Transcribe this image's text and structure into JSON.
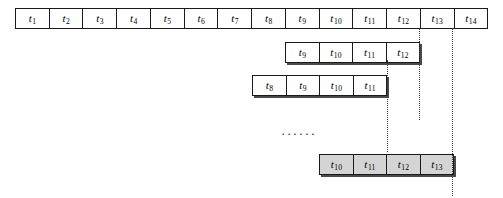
{
  "figure": {
    "ellipsis": "······",
    "colors": {
      "cell_border": "#1a1a1a",
      "shaded_fill": "#d4d4d4",
      "plain_fill": "#ffffff",
      "dotted_line": "#3a3a3a",
      "shadow": "#4a4a4a"
    },
    "rows": [
      {
        "name": "full-timeline",
        "shaded": false,
        "shadow": false,
        "left": 15,
        "top": 8,
        "height": 21,
        "cell_width": 33.8,
        "cells": [
          {
            "base": "t",
            "sub": "1"
          },
          {
            "base": "t",
            "sub": "2"
          },
          {
            "base": "t",
            "sub": "3"
          },
          {
            "base": "t",
            "sub": "4"
          },
          {
            "base": "t",
            "sub": "5"
          },
          {
            "base": "t",
            "sub": "6"
          },
          {
            "base": "t",
            "sub": "7"
          },
          {
            "base": "t",
            "sub": "8"
          },
          {
            "base": "t",
            "sub": "9"
          },
          {
            "base": "t",
            "sub": "10"
          },
          {
            "base": "t",
            "sub": "11"
          },
          {
            "base": "t",
            "sub": "12"
          },
          {
            "base": "t",
            "sub": "13"
          },
          {
            "base": "t",
            "sub": "14"
          }
        ]
      },
      {
        "name": "window-t9-t12",
        "shaded": false,
        "shadow": true,
        "left": 285,
        "top": 42,
        "height": 21,
        "cell_width": 33.8,
        "cells": [
          {
            "base": "t",
            "sub": "9"
          },
          {
            "base": "t",
            "sub": "10"
          },
          {
            "base": "t",
            "sub": "11"
          },
          {
            "base": "t",
            "sub": "12"
          }
        ]
      },
      {
        "name": "window-t8-t11",
        "shaded": false,
        "shadow": true,
        "left": 252,
        "top": 75,
        "height": 21,
        "cell_width": 33.8,
        "cells": [
          {
            "base": "t",
            "sub": "8"
          },
          {
            "base": "t",
            "sub": "9"
          },
          {
            "base": "t",
            "sub": "10"
          },
          {
            "base": "t",
            "sub": "11"
          }
        ]
      },
      {
        "name": "window-t10-t13",
        "shaded": true,
        "shadow": true,
        "left": 319,
        "top": 154,
        "height": 21,
        "cell_width": 33.8,
        "cells": [
          {
            "base": "t",
            "sub": "10"
          },
          {
            "base": "t",
            "sub": "11"
          },
          {
            "base": "t",
            "sub": "12"
          },
          {
            "base": "t",
            "sub": "13"
          }
        ]
      }
    ],
    "guides": [
      {
        "name": "guide-t11-end",
        "left": 387,
        "top": 60,
        "height": 92
      },
      {
        "name": "guide-t12-end",
        "left": 419,
        "top": 28,
        "height": 92
      },
      {
        "name": "guide-t13-end",
        "left": 452,
        "top": 28,
        "height": 168
      }
    ],
    "ellipsis_pos": {
      "left": 281,
      "top": 127
    }
  }
}
